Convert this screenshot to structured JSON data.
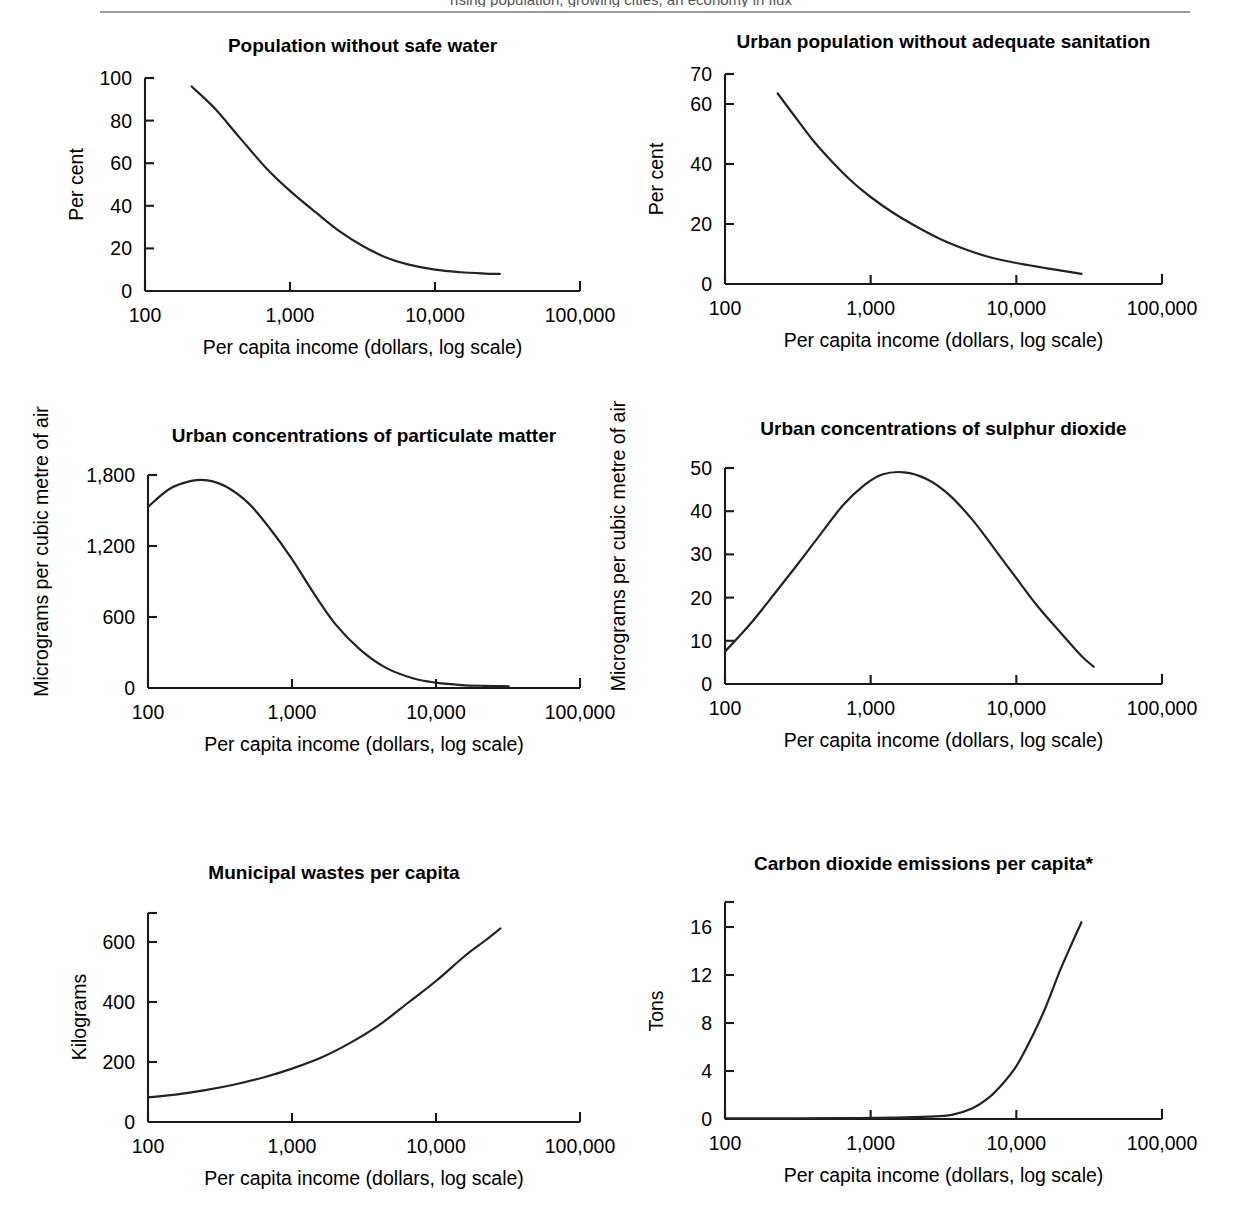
{
  "page": {
    "cutoff_header": "rising population, growing cities, an economy in flux",
    "shared_xlabel": "Per capita income (dollars, log scale)",
    "xtick_labels": [
      "100",
      "1,000",
      "10,000",
      "100,000"
    ],
    "xtick_values": [
      100,
      1000,
      10000,
      100000
    ]
  },
  "chart_data": [
    {
      "id": "population-without-safe-water",
      "type": "line",
      "title": "Population without safe water",
      "xlabel": "Per capita income (dollars, log scale)",
      "ylabel": "Per cent",
      "xscale": "log",
      "xlim": [
        100,
        100000
      ],
      "ylim": [
        0,
        100
      ],
      "yticks": [
        0,
        20,
        40,
        60,
        80,
        100
      ],
      "ytick_labels": [
        "0",
        "20",
        "40",
        "60",
        "80",
        "100"
      ],
      "xticks": [
        100,
        1000,
        10000,
        100000
      ],
      "xtick_labels": [
        "100",
        "1,000",
        "10,000",
        "100,000"
      ],
      "grid": false,
      "legend": "none",
      "x": [
        210,
        300,
        450,
        700,
        1000,
        1500,
        2200,
        3200,
        4500,
        6500,
        10000,
        15000,
        22000,
        28000
      ],
      "y": [
        96,
        86,
        72,
        57,
        47,
        37,
        28,
        21,
        16,
        12.5,
        10,
        8.8,
        8.2,
        8.0
      ]
    },
    {
      "id": "urban-population-without-adequate-sanitation",
      "type": "line",
      "title": "Urban population without adequate sanitation",
      "xlabel": "Per capita income (dollars, log scale)",
      "ylabel": "Per cent",
      "xscale": "log",
      "xlim": [
        100,
        100000
      ],
      "ylim": [
        0,
        70
      ],
      "yticks": [
        0,
        20,
        40,
        60,
        70
      ],
      "ytick_labels": [
        "0",
        "20",
        "40",
        "60",
        "70"
      ],
      "xticks": [
        100,
        1000,
        10000,
        100000
      ],
      "xtick_labels": [
        "100",
        "1,000",
        "10,000",
        "100,000"
      ],
      "grid": false,
      "legend": "none",
      "x": [
        230,
        300,
        400,
        550,
        750,
        1000,
        1400,
        2000,
        3000,
        4500,
        6500,
        10000,
        15000,
        22000,
        28000
      ],
      "y": [
        63.5,
        56,
        48,
        40.5,
        34,
        29,
        24,
        19.5,
        15,
        11.5,
        9,
        7,
        5.5,
        4.2,
        3.4
      ]
    },
    {
      "id": "urban-concentrations-of-particulate-matter",
      "type": "line",
      "title": "Urban concentrations of particulate matter",
      "xlabel": "Per capita income (dollars, log scale)",
      "ylabel": "Micrograms per cubic metre of air",
      "xscale": "log",
      "xlim": [
        100,
        100000
      ],
      "ylim": [
        0,
        1800
      ],
      "yticks": [
        0,
        600,
        1200,
        1800
      ],
      "ytick_labels": [
        "0",
        "600",
        "1,200",
        "1,800"
      ],
      "xticks": [
        100,
        1000,
        10000,
        100000
      ],
      "xtick_labels": [
        "100",
        "1,000",
        "10,000",
        "100,000"
      ],
      "grid": false,
      "legend": "none",
      "x": [
        100,
        140,
        200,
        260,
        350,
        500,
        700,
        1000,
        1400,
        2000,
        3000,
        4500,
        7000,
        10000,
        15000,
        22000,
        32000
      ],
      "y": [
        1530,
        1680,
        1750,
        1755,
        1700,
        1560,
        1350,
        1090,
        810,
        540,
        320,
        170,
        80,
        45,
        25,
        18,
        15
      ]
    },
    {
      "id": "urban-concentrations-of-sulphur-dioxide",
      "type": "line",
      "title": "Urban concentrations of sulphur dioxide",
      "xlabel": "Per capita income (dollars, log scale)",
      "ylabel": "Micrograms per cubic metre of air",
      "xscale": "log",
      "xlim": [
        100,
        100000
      ],
      "ylim": [
        0,
        50
      ],
      "yticks": [
        0,
        10,
        20,
        30,
        40,
        50
      ],
      "ytick_labels": [
        "0",
        "10",
        "20",
        "30",
        "40",
        "50"
      ],
      "xticks": [
        100,
        1000,
        10000,
        100000
      ],
      "xtick_labels": [
        "100",
        "1,000",
        "10,000",
        "100,000"
      ],
      "grid": false,
      "legend": "none",
      "x": [
        100,
        150,
        220,
        320,
        460,
        650,
        900,
        1200,
        1700,
        2400,
        3400,
        5000,
        7000,
        10000,
        14000,
        20000,
        28000,
        34000
      ],
      "y": [
        7.5,
        14,
        21,
        28,
        35,
        41.5,
        46,
        48.5,
        49,
        47.5,
        44,
        38,
        31.5,
        24.5,
        18,
        12,
        6.5,
        4
      ]
    },
    {
      "id": "municipal-wastes-per-capita",
      "type": "line",
      "title": "Municipal wastes per capita",
      "xlabel": "Per capita income (dollars, log scale)",
      "ylabel": "Kilograms",
      "xscale": "log",
      "xlim": [
        100,
        100000
      ],
      "ylim": [
        0,
        700
      ],
      "yticks": [
        0,
        200,
        400,
        600
      ],
      "ytick_labels": [
        "0",
        "200",
        "400",
        "600"
      ],
      "xticks": [
        100,
        1000,
        10000,
        100000
      ],
      "xtick_labels": [
        "100",
        "1,000",
        "10,000",
        "100,000"
      ],
      "grid": false,
      "legend": "none",
      "x": [
        100,
        160,
        250,
        400,
        650,
        1000,
        1600,
        2500,
        4000,
        6500,
        10000,
        16000,
        22000,
        28000
      ],
      "y": [
        82,
        92,
        106,
        125,
        150,
        178,
        215,
        262,
        322,
        400,
        470,
        555,
        605,
        645
      ]
    },
    {
      "id": "carbon-dioxide-emissions-per-capita",
      "type": "line",
      "title": "Carbon dioxide emissions per capita*",
      "xlabel": "Per capita income (dollars, log scale)",
      "ylabel": "Tons",
      "xscale": "log",
      "xlim": [
        100,
        100000
      ],
      "ylim": [
        0,
        18
      ],
      "yticks": [
        0,
        4,
        8,
        12,
        16
      ],
      "ytick_labels": [
        "0",
        "4",
        "8",
        "12",
        "16"
      ],
      "xticks": [
        100,
        1000,
        10000,
        100000
      ],
      "xtick_labels": [
        "100",
        "1,000",
        "10,000",
        "100,000"
      ],
      "grid": false,
      "legend": "none",
      "x": [
        100,
        300,
        700,
        1500,
        2500,
        3600,
        5000,
        6500,
        8000,
        10000,
        13000,
        16000,
        20000,
        24000,
        28000
      ],
      "y": [
        0.05,
        0.06,
        0.08,
        0.12,
        0.2,
        0.35,
        0.9,
        1.8,
        2.9,
        4.4,
        7.0,
        9.4,
        12.4,
        14.6,
        16.4
      ]
    }
  ]
}
